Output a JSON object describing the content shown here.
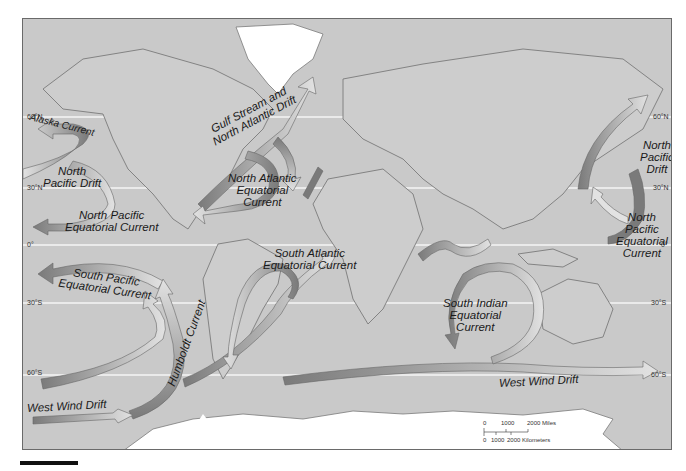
{
  "map": {
    "title": "World Ocean Surface Currents",
    "colors": {
      "ocean": "#c9c9c9",
      "ice": "#ffffff",
      "outline": "#7a7a7a",
      "arrow_dark": "#777777",
      "arrow_light": "#e0e0e0"
    },
    "latitudes": [
      {
        "label": "60°N",
        "y": 116
      },
      {
        "label": "30°N",
        "y": 187
      },
      {
        "label": "0°",
        "y": 244
      },
      {
        "label": "30°S",
        "y": 302
      },
      {
        "label": "60°S",
        "y": 374
      }
    ],
    "currents": [
      {
        "name": "Alaska Current",
        "label": "Alaska Current"
      },
      {
        "name": "North Pacific Drift (east)",
        "label": "North\nPacific Drift"
      },
      {
        "name": "North Pacific Equatorial Current (east)",
        "label": "North Pacific\nEquatorial Current"
      },
      {
        "name": "Gulf Stream and North Atlantic Drift",
        "label": "Gulf Stream and\nNorth Atlantic Drift"
      },
      {
        "name": "North Atlantic Equatorial Current",
        "label": "North Atlantic\nEquatorial\nCurrent"
      },
      {
        "name": "North Pacific Drift (west)",
        "label": "North\nPacific\nDrift"
      },
      {
        "name": "North Pacific Equatorial Current (west)",
        "label": "North\nPacific\nEquatorial\nCurrent"
      },
      {
        "name": "South Pacific Equatorial Current",
        "label": "South Pacific\nEquatorial Current"
      },
      {
        "name": "South Atlantic Equatorial Current",
        "label": "South Atlantic\nEquatorial Current"
      },
      {
        "name": "South Indian Equatorial Current",
        "label": "South Indian\nEquatorial\nCurrent"
      },
      {
        "name": "Humboldt Current",
        "label": "Humboldt Current"
      },
      {
        "name": "West Wind Drift (west)",
        "label": "West Wind Drift"
      },
      {
        "name": "West Wind Drift (east)",
        "label": "West Wind Drift"
      }
    ],
    "scale": {
      "miles_ticks": [
        "0",
        "1000",
        "2000 Miles"
      ],
      "km_ticks": [
        "0",
        "1000",
        "2000 Kilometers"
      ]
    }
  }
}
